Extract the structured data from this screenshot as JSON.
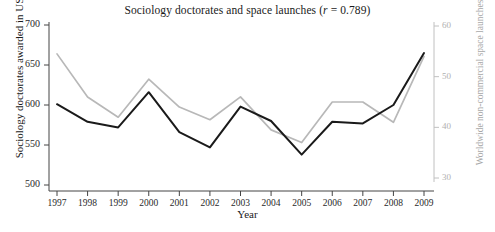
{
  "chart_data": {
    "type": "line",
    "title": "Sociology doctorates and space launches (r = 0.789)",
    "title_prefix": "Sociology doctorates and space launches (",
    "title_stat_symbol": "r",
    "title_stat_value": " = 0.789)",
    "correlation": 0.789,
    "xlabel": "Year",
    "ylabel": "Sociology doctorates awarded in US",
    "ylabel_right": "Worldwide non-commercial space launches",
    "categories": [
      "1997",
      "1998",
      "1999",
      "2000",
      "2001",
      "2002",
      "2003",
      "2004",
      "2005",
      "2006",
      "2007",
      "2008",
      "2009"
    ],
    "x": [
      1997,
      1998,
      1999,
      2000,
      2001,
      2002,
      2003,
      2004,
      2005,
      2006,
      2007,
      2008,
      2009
    ],
    "ylim": [
      500,
      700
    ],
    "yticks": [
      "700",
      "650",
      "600",
      "550",
      "500"
    ],
    "ytick_values": [
      700,
      650,
      600,
      550,
      500
    ],
    "ylim_right": [
      27.5,
      62.5
    ],
    "yticks_right": [
      "60",
      "50",
      "40",
      "30"
    ],
    "ytick_values_right": [
      60,
      50,
      40,
      30
    ],
    "grid": false,
    "legend": "none",
    "series": [
      {
        "name": "Sociology doctorates awarded in US",
        "axis": "left",
        "color": "#1a1a1a",
        "values": [
          601,
          579,
          572,
          616,
          566,
          547,
          598,
          580,
          538,
          579,
          577,
          600,
          665
        ]
      },
      {
        "name": "Worldwide non-commercial space launches",
        "axis": "right",
        "color": "#b8b8b8",
        "values": [
          54.5,
          46.0,
          42.0,
          49.5,
          44.0,
          41.5,
          46.0,
          39.5,
          37.0,
          45.0,
          45.0,
          41.0,
          54.0
        ]
      }
    ],
    "colors": {
      "series_left": "#1a1a1a",
      "series_right": "#b8b8b8",
      "axis_left": "#444444",
      "axis_right": "#c0c0c0",
      "background": "#ffffff"
    }
  }
}
